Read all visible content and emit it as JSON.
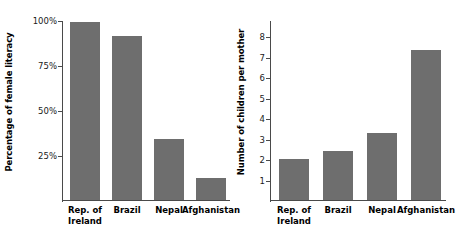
{
  "chart_data": [
    {
      "type": "bar",
      "panel": "left",
      "title": "",
      "xlabel": "",
      "ylabel": "Percentage of female literacy",
      "categories": [
        "Rep. of\nIreland",
        "Brazil",
        "Nepal",
        "Afghanistan"
      ],
      "values": [
        99,
        91,
        34,
        12
      ],
      "ytick_labels": [
        "25%",
        "50%",
        "75%",
        "100%"
      ],
      "ytick_values": [
        25,
        50,
        75,
        100
      ],
      "ylim": [
        0,
        100
      ],
      "grid": false,
      "legend": "none",
      "bar_color": "#6e6e6e",
      "axis_color": "#4a4a4a"
    },
    {
      "type": "bar",
      "panel": "right",
      "title": "",
      "xlabel": "",
      "ylabel": "Number of children per mother",
      "categories": [
        "Rep. of\nIreland",
        "Brazil",
        "Nepal",
        "Afghanistan"
      ],
      "values": [
        2.0,
        2.4,
        3.3,
        7.35
      ],
      "ytick_labels": [
        "1",
        "2",
        "3",
        "4",
        "5",
        "6",
        "7",
        "8"
      ],
      "ytick_values": [
        1,
        2,
        3,
        4,
        5,
        6,
        7,
        8
      ],
      "ylim": [
        0,
        8.8
      ],
      "grid": false,
      "legend": "none",
      "bar_color": "#6e6e6e",
      "axis_color": "#4a4a4a"
    }
  ]
}
